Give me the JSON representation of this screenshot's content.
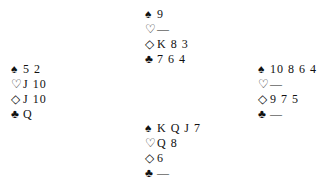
{
  "suits": {
    "spades": "♠",
    "hearts": "♡",
    "diamonds": "◇",
    "clubs": "♣"
  },
  "hands": {
    "north": {
      "spades": "9",
      "hearts": "—",
      "diamonds": "K 8 3",
      "clubs": "7 6 4"
    },
    "west": {
      "spades": "5 2",
      "hearts": "J 10",
      "diamonds": "J 10",
      "clubs": "Q"
    },
    "east": {
      "spades": "10 8 6 4",
      "hearts": "—",
      "diamonds": "9 7 5",
      "clubs": "—"
    },
    "south": {
      "spades": "K Q J 7",
      "hearts": "Q 8",
      "diamonds": "6",
      "clubs": "—"
    }
  }
}
